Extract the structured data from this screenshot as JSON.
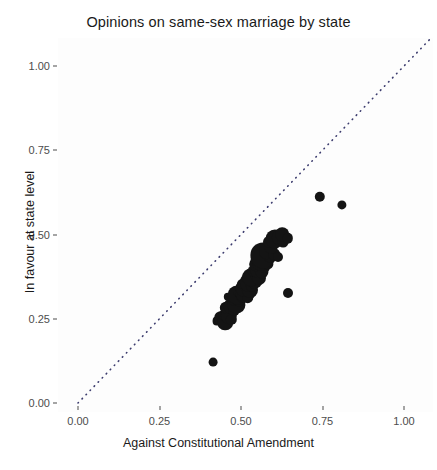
{
  "chart": {
    "title": "Opinions on same-sex marriage by state",
    "xlabel": "Against Constitutional Amendment",
    "ylabel": "In favour at state level"
  },
  "axes": {
    "x_ticks": [
      "0.00",
      "0.25",
      "0.50",
      "0.75",
      "1.00"
    ],
    "y_ticks": [
      "0.00",
      "0.25",
      "0.50",
      "0.75",
      "1.00"
    ]
  },
  "colors": {
    "point": "#141414",
    "refline": "#3c3c6e",
    "axis_text": "#4d4d4d",
    "title_text": "#1a1a1a",
    "panel": "#fdfdfd"
  },
  "chart_data": {
    "type": "scatter",
    "title": "Opinions on same-sex marriage by state",
    "xlabel": "Against Constitutional Amendment",
    "ylabel": "In favour at state level",
    "xlim": [
      0.0,
      1.0
    ],
    "ylim": [
      0.0,
      1.0
    ],
    "grid": false,
    "legend": null,
    "annotations": [
      {
        "type": "reference-line",
        "style": "dotted",
        "description": "y = x diagonal identity line"
      }
    ],
    "size_encodes": "state population (bubble area)",
    "points": [
      {
        "x": 0.415,
        "y": 0.122,
        "s": 4.4
      },
      {
        "x": 0.425,
        "y": 0.243,
        "s": 4.4
      },
      {
        "x": 0.438,
        "y": 0.252,
        "s": 6.8
      },
      {
        "x": 0.452,
        "y": 0.238,
        "s": 7.8
      },
      {
        "x": 0.447,
        "y": 0.262,
        "s": 5.4
      },
      {
        "x": 0.462,
        "y": 0.258,
        "s": 8.2
      },
      {
        "x": 0.47,
        "y": 0.247,
        "s": 5.2
      },
      {
        "x": 0.455,
        "y": 0.283,
        "s": 6.2
      },
      {
        "x": 0.468,
        "y": 0.288,
        "s": 7.4
      },
      {
        "x": 0.478,
        "y": 0.276,
        "s": 6.0
      },
      {
        "x": 0.486,
        "y": 0.292,
        "s": 8.6
      },
      {
        "x": 0.482,
        "y": 0.308,
        "s": 7.0
      },
      {
        "x": 0.493,
        "y": 0.303,
        "s": 5.6
      },
      {
        "x": 0.459,
        "y": 0.316,
        "s": 4.2
      },
      {
        "x": 0.489,
        "y": 0.321,
        "s": 9.4
      },
      {
        "x": 0.497,
        "y": 0.329,
        "s": 6.6
      },
      {
        "x": 0.505,
        "y": 0.318,
        "s": 7.2
      },
      {
        "x": 0.513,
        "y": 0.327,
        "s": 9.8
      },
      {
        "x": 0.521,
        "y": 0.314,
        "s": 5.8
      },
      {
        "x": 0.509,
        "y": 0.342,
        "s": 8.4
      },
      {
        "x": 0.519,
        "y": 0.346,
        "s": 6.4
      },
      {
        "x": 0.528,
        "y": 0.336,
        "s": 8.0
      },
      {
        "x": 0.502,
        "y": 0.353,
        "s": 5.0
      },
      {
        "x": 0.524,
        "y": 0.358,
        "s": 9.2
      },
      {
        "x": 0.534,
        "y": 0.349,
        "s": 6.2
      },
      {
        "x": 0.541,
        "y": 0.362,
        "s": 7.6
      },
      {
        "x": 0.531,
        "y": 0.374,
        "s": 8.8
      },
      {
        "x": 0.546,
        "y": 0.381,
        "s": 6.0
      },
      {
        "x": 0.556,
        "y": 0.372,
        "s": 7.0
      },
      {
        "x": 0.538,
        "y": 0.392,
        "s": 5.4
      },
      {
        "x": 0.552,
        "y": 0.397,
        "s": 8.2
      },
      {
        "x": 0.563,
        "y": 0.389,
        "s": 6.6
      },
      {
        "x": 0.571,
        "y": 0.402,
        "s": 5.2
      },
      {
        "x": 0.547,
        "y": 0.411,
        "s": 6.8
      },
      {
        "x": 0.561,
        "y": 0.417,
        "s": 9.0
      },
      {
        "x": 0.575,
        "y": 0.424,
        "s": 7.4
      },
      {
        "x": 0.583,
        "y": 0.412,
        "s": 5.6
      },
      {
        "x": 0.568,
        "y": 0.438,
        "s": 12.6
      },
      {
        "x": 0.59,
        "y": 0.433,
        "s": 6.2
      },
      {
        "x": 0.579,
        "y": 0.451,
        "s": 7.8
      },
      {
        "x": 0.601,
        "y": 0.441,
        "s": 5.8
      },
      {
        "x": 0.592,
        "y": 0.462,
        "s": 6.4
      },
      {
        "x": 0.612,
        "y": 0.432,
        "s": 5.0
      },
      {
        "x": 0.586,
        "y": 0.479,
        "s": 6.0
      },
      {
        "x": 0.604,
        "y": 0.487,
        "s": 9.6
      },
      {
        "x": 0.618,
        "y": 0.492,
        "s": 7.2
      },
      {
        "x": 0.63,
        "y": 0.478,
        "s": 5.4
      },
      {
        "x": 0.627,
        "y": 0.501,
        "s": 6.8
      },
      {
        "x": 0.643,
        "y": 0.489,
        "s": 5.2
      },
      {
        "x": 0.644,
        "y": 0.326,
        "s": 5.0
      },
      {
        "x": 0.742,
        "y": 0.612,
        "s": 5.2
      },
      {
        "x": 0.81,
        "y": 0.588,
        "s": 4.6
      }
    ]
  }
}
